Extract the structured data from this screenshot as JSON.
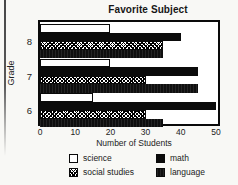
{
  "title": "Favorite Subject",
  "colors": {
    "bar_fill": "#0b0b0b",
    "frame": "#0a0a0a",
    "background": "#f8f8f5"
  },
  "chart_data": {
    "type": "bar",
    "orientation": "horizontal",
    "title": "Favorite Subject",
    "xlabel": "Number of Students",
    "ylabel": "Grade",
    "categories": [
      "8",
      "7",
      "6"
    ],
    "series": [
      {
        "name": "science",
        "pattern": "open",
        "values": [
          20,
          20,
          15
        ]
      },
      {
        "name": "math",
        "pattern": "solid",
        "values": [
          40,
          45,
          50
        ]
      },
      {
        "name": "social studies",
        "pattern": "hatch",
        "values": [
          35,
          30,
          30
        ]
      },
      {
        "name": "language",
        "pattern": "solid-fine",
        "values": [
          35,
          45,
          35
        ]
      }
    ],
    "x_ticks": [
      0,
      10,
      20,
      30,
      40,
      50
    ],
    "xlim": [
      0,
      52
    ],
    "grid": false,
    "legend_position": "bottom-two-column"
  }
}
